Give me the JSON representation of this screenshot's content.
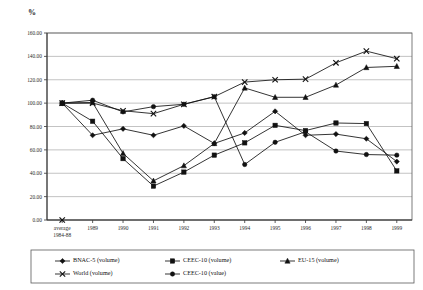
{
  "axis_label": "%",
  "chart_data": {
    "type": "line",
    "title": "",
    "xlabel": "",
    "ylabel": "%",
    "ylim": [
      0,
      160
    ],
    "ytick_step": 20,
    "ytick_labels": [
      "0.00",
      "20.00",
      "40.00",
      "60.00",
      "80.00",
      "100.00",
      "120.00",
      "140.00",
      "160.00"
    ],
    "grid": true,
    "legend_position": "bottom",
    "categories": [
      "average 1984-88",
      "1989",
      "1990",
      "1991",
      "1992",
      "1993",
      "1994",
      "1995",
      "1996",
      "1997",
      "1998",
      "1999"
    ],
    "category_lines": [
      [
        "average",
        "1984-88"
      ],
      [
        "1989"
      ],
      [
        "1990"
      ],
      [
        "1991"
      ],
      [
        "1992"
      ],
      [
        "1993"
      ],
      [
        "1994"
      ],
      [
        "1995"
      ],
      [
        "1996"
      ],
      [
        "1997"
      ],
      [
        "1998"
      ],
      [
        "1999"
      ]
    ],
    "series": [
      {
        "name": "BNAC-5 (volume)",
        "marker": "diamond",
        "values": [
          100.0,
          72.5,
          78.0,
          72.5,
          80.5,
          65.5,
          74.5,
          93.0,
          72.5,
          73.5,
          69.5,
          50.0
        ]
      },
      {
        "name": "CEEC-10 (volume)",
        "marker": "square",
        "values": [
          100.0,
          84.5,
          52.5,
          29.0,
          41.0,
          55.5,
          66.0,
          81.0,
          76.5,
          83.0,
          82.5,
          42.0
        ]
      },
      {
        "name": "EU-15 (volume)",
        "marker": "triangle",
        "values": [
          100.0,
          100.5,
          57.0,
          33.5,
          46.5,
          65.5,
          113.0,
          105.0,
          105.0,
          115.5,
          130.5,
          131.5
        ]
      },
      {
        "name": "World (volume)",
        "marker": "cross",
        "values": [
          100.0,
          100.0,
          93.5,
          91.0,
          99.0,
          105.5,
          118.0,
          120.0,
          120.5,
          134.5,
          144.5,
          138.0
        ]
      },
      {
        "name": "CEEC-10 (value)",
        "marker": "circle",
        "values": [
          100.0,
          102.5,
          92.5,
          97.0,
          99.0,
          105.5,
          47.5,
          66.5,
          75.5,
          59.0,
          56.0,
          55.5
        ]
      }
    ],
    "baseline_marker": {
      "category": "average 1984-88",
      "value": 0.0,
      "marker": "cross"
    }
  },
  "legend": {
    "entries": [
      {
        "label": "BNAC-5 (volume)",
        "marker": "diamond"
      },
      {
        "label": "CEEC-10 (volume)",
        "marker": "square"
      },
      {
        "label": "EU-15 (volume)",
        "marker": "triangle"
      },
      {
        "label": "World (volume)",
        "marker": "cross"
      },
      {
        "label": "CEEC-10 (value)",
        "marker": "circle"
      }
    ]
  },
  "colors": {
    "ink": "#111111",
    "grid": "#9a9a9a",
    "frame": "#5a5a5a"
  }
}
